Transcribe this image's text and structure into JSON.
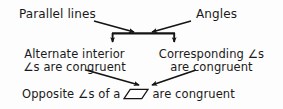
{
  "diagram": {
    "type": "flowchart",
    "background_color": "#fdfdfd",
    "text_color": "#1a1a1a",
    "nodes": [
      {
        "id": "parallel-lines",
        "label": "Parallel lines",
        "level": "top-left"
      },
      {
        "id": "angles",
        "label": "Angles",
        "level": "top-right"
      },
      {
        "id": "alternate-interior",
        "line1": "Alternate interior",
        "line2": "∠s are congruent",
        "level": "middle-left"
      },
      {
        "id": "corresponding",
        "line1": "Corresponding ∠s",
        "line2": "are congruent",
        "level": "middle-right"
      },
      {
        "id": "opposite",
        "prefix": "Opposite ∠s of a",
        "symbol": "parallelogram",
        "suffix": "are congruent",
        "level": "bottom"
      }
    ],
    "edges": [
      {
        "id": "parallel-to-junction",
        "from": "parallel-lines",
        "to": "junction",
        "style": "arrow-diagonal-right-down"
      },
      {
        "id": "angles-to-junction",
        "from": "angles",
        "to": "junction",
        "style": "arrow-diagonal-left-down"
      },
      {
        "id": "junction-to-alternate",
        "from": "junction",
        "to": "alternate-interior",
        "style": "arrow-down"
      },
      {
        "id": "junction-to-corresponding",
        "from": "junction",
        "to": "corresponding",
        "style": "arrow-down"
      },
      {
        "id": "alternate-to-opposite",
        "from": "alternate-interior",
        "to": "opposite",
        "style": "arrow-diagonal-right-down"
      },
      {
        "id": "corresponding-to-opposite",
        "from": "corresponding",
        "to": "opposite",
        "style": "arrow-diagonal-left-down"
      }
    ],
    "junction": {
      "id": "junction-bar",
      "description": "horizontal connector bar where top arrows meet and branch downward"
    }
  }
}
